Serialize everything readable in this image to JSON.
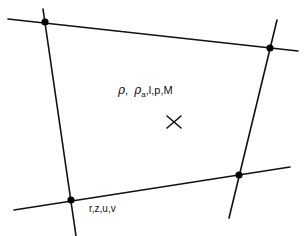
{
  "diagram": {
    "type": "grid-cell-schematic",
    "colors": {
      "line": "#111111",
      "node": "#000000",
      "background": "#ffffff"
    },
    "cell_center_label": {
      "symbol_rho": "ρ",
      "separator": ",",
      "symbol_rho_a": "ρ",
      "subscript_a": "a",
      "rest": ",l,p,M"
    },
    "cell_center_marker": "x-marker",
    "vertex_label": "r,z,u,v",
    "nodes": [
      {
        "id": "top-left",
        "x": 45,
        "y": 22
      },
      {
        "id": "top-right",
        "x": 270,
        "y": 48
      },
      {
        "id": "bottom-right",
        "x": 239,
        "y": 175
      },
      {
        "id": "bottom-left",
        "x": 71,
        "y": 200
      }
    ],
    "lines": [
      {
        "id": "top-line",
        "x1": 8,
        "y1": 19,
        "x2": 298,
        "y2": 51
      },
      {
        "id": "bottom-line",
        "x1": 14,
        "y1": 210,
        "x2": 290,
        "y2": 167
      },
      {
        "id": "left-line",
        "x1": 43,
        "y1": 9,
        "x2": 76,
        "y2": 236
      },
      {
        "id": "right-line",
        "x1": 277,
        "y1": 20,
        "x2": 229,
        "y2": 218
      }
    ],
    "center_marker": {
      "x": 174,
      "y": 122,
      "size": 14
    }
  }
}
